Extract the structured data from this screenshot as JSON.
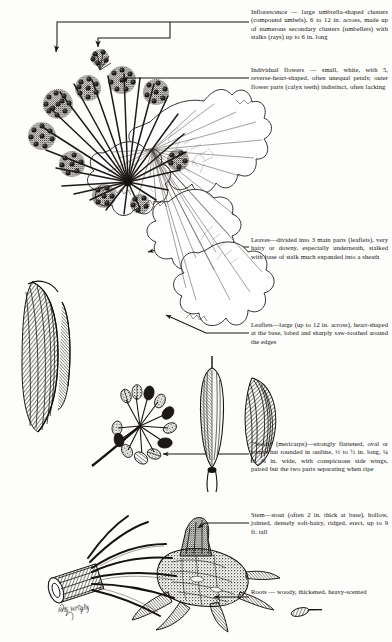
{
  "plate": {
    "subject": "Giant hogweed (Heracleum) botanical identification plate",
    "ink_color": "#1a1715",
    "paper_color": "#fdfdfc",
    "artist_signature": "R.E.Wright"
  },
  "captions": [
    {
      "id": "inflorescence",
      "term": "Inflorescence",
      "text": "Inflorescence — large umbrella-shaped clusters (compound umbels), 6 to 12 in. across, made up of numerous secondary clusters (umbellets) with stalks (rays) up to 6 in. long"
    },
    {
      "id": "flowers",
      "term": "Individual flowers",
      "text": "Individual flowers — small, white, with 5, reverse-heart-shaped, often unequal petals; outer flower parts (calyx teeth) indistinct, often lacking"
    },
    {
      "id": "leaves",
      "term": "Leaves",
      "text": "Leaves—divided into 3 main parts (leaflets), very hairy or downy, especially underneath, stalked with base of stalk much expanded into a sheath"
    },
    {
      "id": "leaflets",
      "term": "Leaflets",
      "text": "Leaflets—large (up to 12 in. across), heart-shaped at the base, lobed and sharply saw-toothed around the edges"
    },
    {
      "id": "seeds",
      "term": "“Seeds” (mericarps)",
      "text": "“Seeds” (mericarps)—strongly flattened, oval or somewhat rounded in outline, ⅓ to ½ in. long, ¼ to ⅜ in. wide, with conspicuous side wings, paired but the two parts separating when ripe"
    },
    {
      "id": "stem",
      "term": "Stem",
      "text": "Stem—stout (often 2 in. thick at base), hollow, jointed, densely soft-hairy, ridged, erect, up to 9 ft. tall"
    },
    {
      "id": "roots",
      "term": "Roots",
      "text": "Roots — woody, thickened, heavy-scented"
    }
  ],
  "figures": [
    {
      "id": "compound-umbel",
      "label": "compound umbel of flowers"
    },
    {
      "id": "large-leaf",
      "label": "large three-parted leaf"
    },
    {
      "id": "sheathing-base",
      "label": "expanded sheathing leaf-stalk base"
    },
    {
      "id": "umbellet-fruits",
      "label": "umbellet with ripening mericarps"
    },
    {
      "id": "mericarp-pair",
      "label": "enlarged paired mericarps"
    },
    {
      "id": "mericarp-wing",
      "label": "enlarged winged mericarp face"
    },
    {
      "id": "stem-section",
      "label": "hollow jointed stem section"
    },
    {
      "id": "root-crown",
      "label": "woody thickened root crown"
    }
  ]
}
